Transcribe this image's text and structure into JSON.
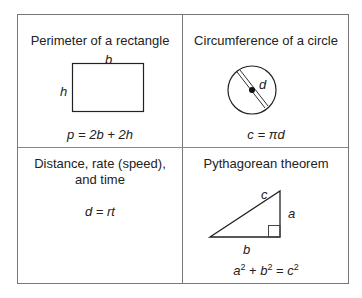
{
  "cells": [
    {
      "title": "Perimeter of a rectangle",
      "labels": {
        "top": "b",
        "left": "h"
      },
      "formula": "p  = 2b + 2h",
      "shape": "rectangle-icon"
    },
    {
      "title": "Circumference of a circle",
      "labels": {
        "diameter": "d"
      },
      "formula": "c = πd",
      "shape": "circle-icon"
    },
    {
      "title_line1": "Distance, rate (speed),",
      "title_line2": "and time",
      "formula": "d  = rt"
    },
    {
      "title": "Pythagorean theorem",
      "labels": {
        "hyp": "c",
        "vertical": "a",
        "base": "b"
      },
      "formula_parts": {
        "a": "a",
        "b": "b",
        "c": "c",
        "exp": "2",
        "plus": " + ",
        "eq": " = "
      },
      "shape": "right-triangle-icon"
    }
  ]
}
